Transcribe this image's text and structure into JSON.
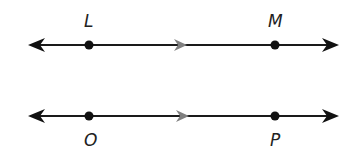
{
  "diagram": {
    "colors": {
      "line": "#1a1a1a",
      "marker": "#808080",
      "point": "#111111"
    },
    "lines": [
      {
        "name": "line-LM",
        "y": 45,
        "points": [
          {
            "label": "L",
            "x": 89,
            "label_position": "above"
          },
          {
            "label": "M",
            "x": 275,
            "label_position": "above"
          }
        ]
      },
      {
        "name": "line-OP",
        "y": 116,
        "points": [
          {
            "label": "O",
            "x": 89,
            "label_position": "below"
          },
          {
            "label": "P",
            "x": 275,
            "label_position": "below"
          }
        ]
      }
    ],
    "labels": {
      "L": "L",
      "M": "M",
      "O": "O",
      "P": "P"
    }
  }
}
